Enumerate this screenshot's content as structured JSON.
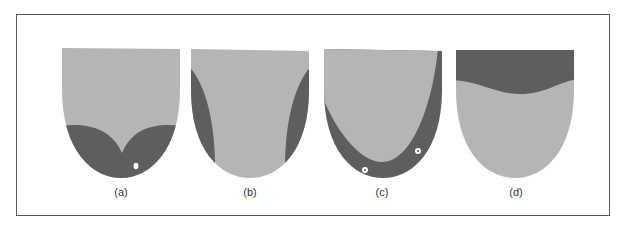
{
  "figure": {
    "panels": [
      {
        "id": "a",
        "label": "(a)",
        "description": "Dark region at tip with two lobes meeting at center; white marker near right tip"
      },
      {
        "id": "b",
        "label": "(b)",
        "description": "Dark bands along both lateral edges"
      },
      {
        "id": "c",
        "label": "(c)",
        "description": "Dark U-shaped band along tip and sides; two white circular markers"
      },
      {
        "id": "d",
        "label": "(d)",
        "description": "Dark band across the back (top) with wavy lower edge"
      }
    ],
    "colors": {
      "light_region": "#b5b5b5",
      "dark_region": "#5e5e5e",
      "marker": "#ffffff",
      "border": "#555555"
    }
  }
}
